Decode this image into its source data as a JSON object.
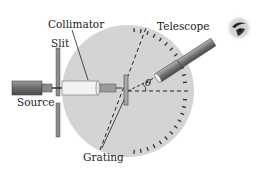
{
  "diagram": {
    "labels": {
      "collimator": "Collimator",
      "slit": "Slit",
      "telescope": "Telescope",
      "source": "Source",
      "grating": "Grating",
      "angle": "θ"
    },
    "components": [
      "Source",
      "Slit",
      "Collimator",
      "Grating",
      "Telescope",
      "Eye",
      "Rotating table with angular scale"
    ],
    "colors": {
      "table": "#d4d4d4",
      "ticks": "#333333",
      "tube": "#8a8a8a",
      "slit": "#8c8c8c",
      "line": "#222222"
    }
  }
}
